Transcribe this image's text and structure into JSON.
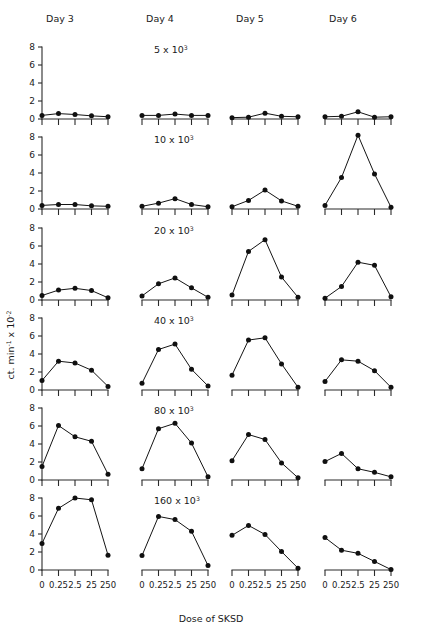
{
  "figure": {
    "columns": [
      "Day 3",
      "Day 4",
      "Day 5",
      "Day 6"
    ],
    "row_titles": [
      "5 x 10",
      "10 x 10",
      "20 x 10",
      "40 x 10",
      "80 x 10",
      "160 x 10"
    ],
    "row_title_exponent": "3",
    "y_axis_label_main": "ct. min",
    "y_axis_label_sup1": "-1",
    "y_axis_label_mid": " x 10",
    "y_axis_label_sup2": "-2",
    "x_axis_label": "Dose of SKSD",
    "y_tick_labels": [
      "0",
      "2",
      "4",
      "6",
      "8"
    ],
    "x_tick_labels": [
      "0",
      "0.25",
      "2.5",
      "25",
      "250"
    ]
  },
  "chart_data": {
    "type": "line",
    "title": "",
    "xlabel": "Dose of SKSD",
    "ylabel": "ct. min-1 x 10-2",
    "x": [
      "0",
      "0.25",
      "2.5",
      "25",
      "250"
    ],
    "ylim": [
      0,
      8
    ],
    "yticks": [
      0,
      2,
      4,
      6,
      8
    ],
    "grid": false,
    "legend": "none",
    "panel_rows": [
      "5 x 10^3",
      "10 x 10^3",
      "20 x 10^3",
      "40 x 10^3",
      "80 x 10^3",
      "160 x 10^3"
    ],
    "panel_columns": [
      "Day 3",
      "Day 4",
      "Day 5",
      "Day 6"
    ],
    "panels": [
      {
        "row": "5 x 10^3",
        "column": "Day 3",
        "values": [
          0.4,
          0.6,
          0.5,
          0.35,
          0.25
        ]
      },
      {
        "row": "5 x 10^3",
        "column": "Day 4",
        "values": [
          0.4,
          0.4,
          0.55,
          0.4,
          0.4
        ]
      },
      {
        "row": "5 x 10^3",
        "column": "Day 5",
        "values": [
          0.15,
          0.2,
          0.65,
          0.3,
          0.25
        ]
      },
      {
        "row": "5 x 10^3",
        "column": "Day 6",
        "values": [
          0.25,
          0.3,
          0.8,
          0.2,
          0.25
        ]
      },
      {
        "row": "10 x 10^3",
        "column": "Day 3",
        "values": [
          0.4,
          0.5,
          0.5,
          0.35,
          0.3
        ]
      },
      {
        "row": "10 x 10^3",
        "column": "Day 4",
        "values": [
          0.3,
          0.65,
          1.15,
          0.5,
          0.25
        ]
      },
      {
        "row": "10 x 10^3",
        "column": "Day 5",
        "values": [
          0.25,
          0.95,
          2.1,
          0.9,
          0.3
        ]
      },
      {
        "row": "10 x 10^3",
        "column": "Day 6",
        "values": [
          0.4,
          3.5,
          8.2,
          3.9,
          0.2
        ]
      },
      {
        "row": "20 x 10^3",
        "column": "Day 3",
        "values": [
          0.5,
          1.1,
          1.3,
          1.05,
          0.25
        ]
      },
      {
        "row": "20 x 10^3",
        "column": "Day 4",
        "values": [
          0.45,
          1.8,
          2.45,
          1.35,
          0.3
        ]
      },
      {
        "row": "20 x 10^3",
        "column": "Day 5",
        "values": [
          0.55,
          5.4,
          6.7,
          2.55,
          0.3
        ]
      },
      {
        "row": "20 x 10^3",
        "column": "Day 6",
        "values": [
          0.2,
          1.5,
          4.2,
          3.85,
          0.35
        ]
      },
      {
        "row": "40 x 10^3",
        "column": "Day 3",
        "values": [
          1.05,
          3.2,
          3.0,
          2.2,
          0.4
        ]
      },
      {
        "row": "40 x 10^3",
        "column": "Day 4",
        "values": [
          0.75,
          4.5,
          5.1,
          2.3,
          0.45
        ]
      },
      {
        "row": "40 x 10^3",
        "column": "Day 5",
        "values": [
          1.65,
          5.55,
          5.8,
          2.9,
          0.3
        ]
      },
      {
        "row": "40 x 10^3",
        "column": "Day 6",
        "values": [
          0.95,
          3.35,
          3.2,
          2.15,
          0.3
        ]
      },
      {
        "row": "80 x 10^3",
        "column": "Day 3",
        "values": [
          1.5,
          6.05,
          4.8,
          4.3,
          0.65
        ]
      },
      {
        "row": "80 x 10^3",
        "column": "Day 4",
        "values": [
          1.25,
          5.7,
          6.3,
          4.1,
          0.35
        ]
      },
      {
        "row": "80 x 10^3",
        "column": "Day 5",
        "values": [
          2.15,
          5.05,
          4.5,
          1.9,
          0.25
        ]
      },
      {
        "row": "80 x 10^3",
        "column": "Day 6",
        "values": [
          2.05,
          2.95,
          1.25,
          0.85,
          0.35
        ]
      },
      {
        "row": "160 x 10^3",
        "column": "Day 3",
        "values": [
          2.95,
          6.85,
          8.0,
          7.8,
          1.65
        ]
      },
      {
        "row": "160 x 10^3",
        "column": "Day 4",
        "values": [
          1.6,
          5.95,
          5.6,
          4.3,
          0.5
        ]
      },
      {
        "row": "160 x 10^3",
        "column": "Day 5",
        "values": [
          3.85,
          4.95,
          3.95,
          2.05,
          0.2
        ]
      },
      {
        "row": "160 x 10^3",
        "column": "Day 6",
        "values": [
          3.6,
          2.2,
          1.85,
          0.95,
          0.05
        ]
      }
    ]
  }
}
